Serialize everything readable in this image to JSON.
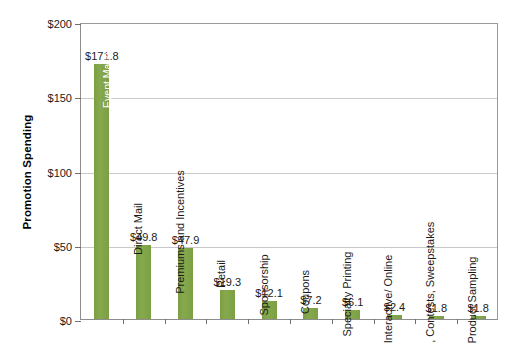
{
  "chart_data": {
    "type": "bar",
    "title": "",
    "xlabel": "",
    "ylabel": "Promotion Spending",
    "ylim": [
      0,
      200
    ],
    "yticks": [
      "$0",
      "$50",
      "$100",
      "$150",
      "$200"
    ],
    "ytick_values": [
      0,
      50,
      100,
      150,
      200
    ],
    "grid": "horizontal",
    "legend": "none",
    "orientation": "vertical",
    "categories": [
      "Event Marketing",
      "Direct Mail",
      "Premiums and Incentives",
      "Retail",
      "Sponsorship",
      "Coupons",
      "Specialty Printing",
      "Interactive/ Online",
      "Games, Contests, Sweepstakes",
      "Product Sampling"
    ],
    "values": [
      171.8,
      49.8,
      47.9,
      19.3,
      12.1,
      7.2,
      6.1,
      2.4,
      1.8,
      1.8
    ],
    "data_labels": [
      "$171.8",
      "$49.8",
      "$47.9",
      "$19.3",
      "$12.1",
      "$7.2",
      "$6.1",
      "$2.4",
      "$1.8",
      "$1.8"
    ],
    "label_placement": [
      "inside",
      "outside",
      "outside",
      "outside",
      "outside",
      "outside",
      "outside",
      "outside",
      "outside",
      "outside"
    ],
    "colors": {
      "bar": "#7ba03c",
      "grid": "#c9c9c9",
      "axis": "#8d8d8d",
      "text": "#1a1a1a",
      "inside_label": "#ffffff",
      "background": "#ffffff"
    }
  }
}
